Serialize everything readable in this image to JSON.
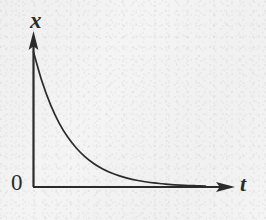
{
  "figure": {
    "background_color": "#f4f4f4",
    "ink_color": "#2b2b2b",
    "width": 266,
    "height": 220
  },
  "labels": {
    "y_axis": "x",
    "x_axis": "t",
    "origin": "0"
  },
  "chart_data": {
    "type": "line",
    "title": "",
    "subtitle": "",
    "xlabel": "t",
    "ylabel": "x",
    "grid": false,
    "legend": null,
    "annotations": [],
    "axis_style": {
      "type": "arrowed-half-axes",
      "origin_label": "0",
      "ticks": false,
      "tick_labels": []
    },
    "xlim": [
      0,
      1
    ],
    "ylim": [
      0,
      1
    ],
    "series": [
      {
        "name": "exponential decay",
        "color": "#2b2b2b",
        "x": [
          0.0,
          0.05,
          0.1,
          0.15,
          0.2,
          0.25,
          0.3,
          0.35,
          0.4,
          0.45,
          0.5,
          0.55,
          0.6,
          0.65,
          0.7,
          0.75,
          0.8,
          0.85,
          0.9,
          0.95,
          1.0
        ],
        "y": [
          1.0,
          0.779,
          0.607,
          0.472,
          0.368,
          0.287,
          0.223,
          0.174,
          0.135,
          0.105,
          0.082,
          0.064,
          0.05,
          0.039,
          0.03,
          0.024,
          0.018,
          0.014,
          0.011,
          0.009,
          0.007
        ]
      }
    ]
  }
}
